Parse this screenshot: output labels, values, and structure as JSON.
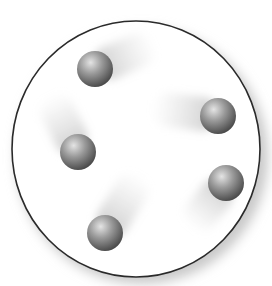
{
  "diagram": {
    "container": {
      "shape": "circle",
      "cx": 136,
      "cy": 149,
      "rx": 124,
      "ry": 128,
      "stroke": "#2a2a2a",
      "fill": "#ffffff",
      "shadow": "#cfcfcf"
    },
    "particles": [
      {
        "id": "particle-1",
        "cx": 95,
        "cy": 69,
        "r": 18,
        "trail_dx": 42,
        "trail_dy": -18
      },
      {
        "id": "particle-2",
        "cx": 218,
        "cy": 116,
        "r": 18,
        "trail_dx": -48,
        "trail_dy": -6
      },
      {
        "id": "particle-3",
        "cx": 78,
        "cy": 152,
        "r": 18,
        "trail_dx": -20,
        "trail_dy": -40
      },
      {
        "id": "particle-4",
        "cx": 105,
        "cy": 233,
        "r": 18,
        "trail_dx": 26,
        "trail_dy": -42
      },
      {
        "id": "particle-5",
        "cx": 226,
        "cy": 183,
        "r": 18,
        "trail_dx": -24,
        "trail_dy": 30
      }
    ],
    "colors": {
      "particle_light": "#d9d9d9",
      "particle_mid": "#8a8a8a",
      "particle_dark": "#4a4a4a",
      "trail": "#bdbdbd"
    }
  }
}
